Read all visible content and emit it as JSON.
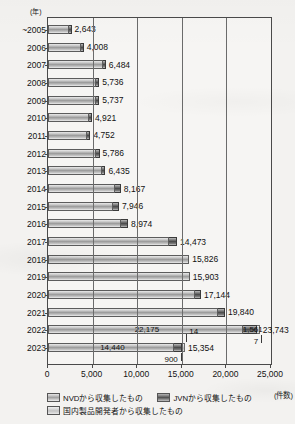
{
  "chart_data": {
    "type": "bar",
    "orientation": "horizontal",
    "stacked": true,
    "title": "",
    "xlabel": "(件数)",
    "ylabel": "(年)",
    "xlim": [
      0,
      25000
    ],
    "xticks": [
      0,
      5000,
      10000,
      15000,
      20000,
      25000
    ],
    "xticklabels": [
      "0",
      "5,000",
      "10,000",
      "15,000",
      "20,000",
      "25,000"
    ],
    "grid": true,
    "legend_position": "bottom",
    "categories": [
      "~2005",
      "2006",
      "2007",
      "2008",
      "2009",
      "2010",
      "2011",
      "2012",
      "2013",
      "2014",
      "2015",
      "2016",
      "2017",
      "2018",
      "2019",
      "2020",
      "2021",
      "2022",
      "2023"
    ],
    "series": [
      {
        "name": "NVDから収集したもの",
        "key": "nvd",
        "values": [
          2450,
          3760,
          6130,
          5400,
          5380,
          4620,
          4380,
          5400,
          6010,
          7560,
          7280,
          8180,
          13600,
          15826,
          15903,
          16500,
          19100,
          22175,
          14440
        ]
      },
      {
        "name": "JVNから収集したもの",
        "key": "jvn",
        "values": [
          193,
          248,
          354,
          336,
          357,
          301,
          372,
          386,
          425,
          607,
          666,
          794,
          873,
          0,
          0,
          644,
          740,
          1561,
          900
        ]
      },
      {
        "name": "国内製品開発者から収集したもの",
        "key": "dom",
        "values": [
          0,
          0,
          0,
          0,
          0,
          0,
          0,
          0,
          0,
          0,
          0,
          0,
          0,
          0,
          0,
          0,
          0,
          7,
          14
        ]
      }
    ],
    "totals": [
      2643,
      4008,
      6484,
      5736,
      5737,
      4921,
      4752,
      5786,
      6435,
      8167,
      7946,
      8974,
      14473,
      15826,
      15903,
      17144,
      19840,
      23743,
      15354
    ],
    "total_labels": [
      "2,643",
      "4,008",
      "6,484",
      "5,736",
      "5,737",
      "4,921",
      "4,752",
      "5,786",
      "6,435",
      "8,167",
      "7,946",
      "8,974",
      "14,473",
      "15,826",
      "15,903",
      "17,144",
      "19,840",
      "23,743",
      "15,354"
    ],
    "segment_annotations": [
      {
        "category": "2022",
        "label": "22,175",
        "value": 22175,
        "series": "nvd",
        "placement": "inside"
      },
      {
        "category": "2022",
        "label": "1,561",
        "value": 1561,
        "series": "jvn",
        "placement": "inside"
      },
      {
        "category": "2022",
        "label": "7",
        "value": 7,
        "series": "dom",
        "placement": "callout-below"
      },
      {
        "category": "2023",
        "label": "14,440",
        "value": 14440,
        "series": "nvd",
        "placement": "inside"
      },
      {
        "category": "2023",
        "label": "900",
        "value": 900,
        "series": "jvn",
        "placement": "callout-below"
      },
      {
        "category": "2023",
        "label": "14",
        "value": 14,
        "series": "dom",
        "placement": "callout-above"
      }
    ]
  },
  "axis": {
    "year_unit": "(年)",
    "count_unit": "(件数)"
  },
  "legend": {
    "items": [
      {
        "label": "NVDから収集したもの",
        "key": "nvd"
      },
      {
        "label": "JVNから収集したもの",
        "key": "jvn"
      },
      {
        "label": "国内製品開発者から収集したもの",
        "key": "dom"
      }
    ]
  }
}
